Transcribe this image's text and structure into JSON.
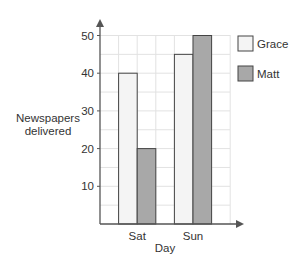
{
  "chart_data": {
    "type": "bar",
    "title": "",
    "xlabel": "Day",
    "ylabel": "Newspapers delivered",
    "ylabel_lines": [
      "Newspapers",
      "delivered"
    ],
    "categories": [
      "Sat",
      "Sun"
    ],
    "series": [
      {
        "name": "Grace",
        "values": [
          40,
          45
        ],
        "color": "#f4f4f4"
      },
      {
        "name": "Matt",
        "values": [
          20,
          50
        ],
        "color": "#a8a8a8"
      }
    ],
    "yticks": [
      10,
      20,
      30,
      40,
      50
    ],
    "ylim": [
      0,
      50
    ],
    "grid": true,
    "legend_position": "right"
  }
}
